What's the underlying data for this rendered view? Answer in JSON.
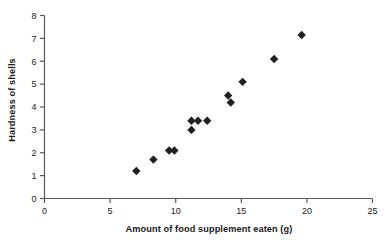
{
  "chart_data": {
    "type": "scatter",
    "title": "",
    "xlabel": "Amount of food supplement eaten (g)",
    "ylabel": "Hardness of shells",
    "xlim": [
      0,
      25
    ],
    "ylim": [
      0,
      8
    ],
    "xticks": [
      0,
      5,
      10,
      15,
      20,
      25
    ],
    "yticks": [
      0,
      1,
      2,
      3,
      4,
      5,
      6,
      7,
      8
    ],
    "xtick_labels": [
      "0",
      "5",
      "10",
      "15",
      "20",
      "25"
    ],
    "ytick_labels": [
      "0",
      "1",
      "2",
      "3",
      "4",
      "5",
      "6",
      "7",
      "8"
    ],
    "grid": false,
    "legend": false,
    "marker": "diamond",
    "marker_color": "#231f20",
    "series": [
      {
        "name": "shell hardness vs supplement",
        "points": [
          {
            "x": 7.0,
            "y": 1.2
          },
          {
            "x": 8.3,
            "y": 1.7
          },
          {
            "x": 9.5,
            "y": 2.1
          },
          {
            "x": 9.9,
            "y": 2.1
          },
          {
            "x": 11.2,
            "y": 3.4
          },
          {
            "x": 11.2,
            "y": 3.0
          },
          {
            "x": 11.7,
            "y": 3.4
          },
          {
            "x": 12.4,
            "y": 3.4
          },
          {
            "x": 14.0,
            "y": 4.5
          },
          {
            "x": 14.2,
            "y": 4.2
          },
          {
            "x": 15.1,
            "y": 5.1
          },
          {
            "x": 17.5,
            "y": 6.1
          },
          {
            "x": 19.6,
            "y": 7.15
          }
        ]
      }
    ],
    "axis_color": "#58595b",
    "text_color": "#1a1a1a"
  }
}
